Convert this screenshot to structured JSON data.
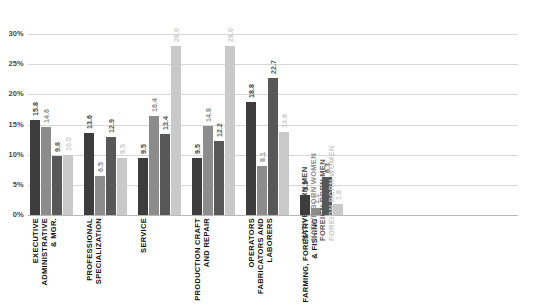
{
  "chart_data": {
    "type": "bar",
    "title": "",
    "subtitle": "",
    "xlabel": "",
    "ylabel": "",
    "ylim": [
      0,
      32
    ],
    "grid": true,
    "legend_position": "inside-right-vertical",
    "ytick_labels": [
      "0%",
      "5%",
      "10%",
      "15%",
      "20%",
      "25%",
      "30%"
    ],
    "ytick_values": [
      0,
      5,
      10,
      15,
      20,
      25,
      30
    ],
    "categories": [
      "EXECUTIVE ADMINISTRATIVE & MGR.",
      "PROFESSIONAL SPECIALIZATION",
      "SERVICE",
      "PRODUCTION CRAFT AND REPAIR",
      "OPERATORS FABRICATORS AND LABORERS",
      "FARMING, FORESTRY & FISHING"
    ],
    "category_lines": [
      [
        "EXECUTIVE",
        "ADMINISTRATIVE",
        "& MGR."
      ],
      [
        "PROFESSIONAL",
        "SPECIALIZATION"
      ],
      [
        "SERVICE"
      ],
      [
        "PRODUCTION CRAFT",
        "AND REPAIR"
      ],
      [
        "OPERATORS",
        "FABRICATORS AND",
        "LABORERS"
      ],
      [
        "FARMING, FORESTRY",
        "& FISHING"
      ]
    ],
    "series": [
      {
        "name": "NATIVE BORN MEN",
        "color": "#3d3d3d",
        "values": [
          15.8,
          13.6,
          9.5,
          9.5,
          18.8,
          3.3
        ],
        "labels": [
          "15.8",
          "13.6",
          "9.5",
          "9.5",
          "18.8",
          "3.3"
        ]
      },
      {
        "name": "NATIVE BORN WOMEN",
        "color": "#8c8c8c",
        "values": [
          14.6,
          6.5,
          16.4,
          14.8,
          8.1,
          1.1
        ],
        "labels": [
          "14.6",
          "6.5",
          "16.4",
          "14.8",
          "8.1",
          "1.1"
        ]
      },
      {
        "name": "FOREIGN BORN MEN",
        "color": "#585858",
        "values": [
          9.8,
          12.9,
          13.4,
          12.2,
          22.7,
          6.3
        ],
        "labels": [
          "9.8",
          "12.9",
          "13.4",
          "12.2",
          "22.7",
          "6.3"
        ]
      },
      {
        "name": "FOREIGN BORN WOMEN",
        "color": "#c9c9c9",
        "values": [
          10.0,
          9.5,
          28.0,
          28.0,
          13.8,
          1.8
        ],
        "labels": [
          "10.0",
          "9.5",
          "28.0",
          "28.0",
          "13.8",
          "1.8"
        ]
      }
    ]
  }
}
